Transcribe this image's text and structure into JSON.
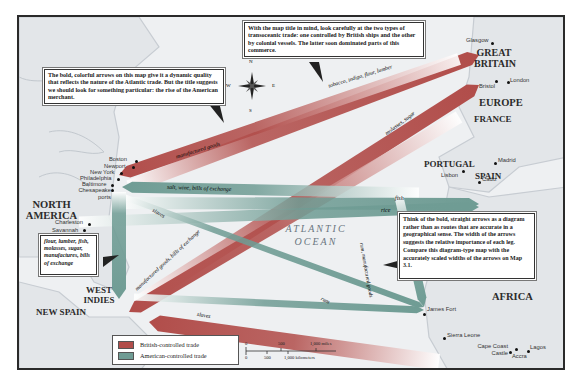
{
  "map": {
    "legend": {
      "british_label": "British-controlled trade",
      "american_label": "American-controlled trade",
      "british_color": "#b14d4a",
      "american_color": "#6f9c94"
    },
    "callouts": {
      "top": "With the map title in mind, look carefully at the two types of transoceanic trade: one controlled by British ships and the other by colonial vessels. The latter soon dominated parts of this commerce.",
      "left": "The bold, colorful arrows on this map give it a dynamic quality that reflects the nature of the Atlantic trade. But the title suggests we should look for something particular: the rise of the American merchant.",
      "right": "Think of the bold, straight arrows as a diagram rather than as routes that are accurate in a geographical sense. The width of the arrows suggests the relative importance of each leg. Compare this diagram-type map with the accurately scaled widths of the arrows on Map 3.1.",
      "goods": "flour, lumber, fish, molasses, sugar, manufactures, bills of exchange"
    },
    "compass": {
      "n": "N",
      "s": "S",
      "e": "E",
      "w": "W"
    },
    "regions": {
      "north_america": "NORTH AMERICA",
      "great_britain": "GREAT BRITAIN",
      "europe": "EUROPE",
      "france": "FRANCE",
      "portugal": "PORTUGAL",
      "spain": "SPAIN",
      "africa": "AFRICA",
      "west_indies": "WEST INDIES",
      "new_spain": "NEW SPAIN",
      "ocean": "ATLANTIC OCEAN"
    },
    "cities": {
      "boston": "Boston",
      "newport": "Newport",
      "new_york": "New York",
      "philadelphia": "Philadelphia",
      "baltimore": "Baltimore",
      "chesapeake": "Chesapeake ports",
      "charleston": "Charleston",
      "savannah": "Savannah",
      "glasgow": "Glasgow",
      "bristol": "Bristol",
      "london": "London",
      "madrid": "Madrid",
      "lisbon": "Lisbon",
      "cadiz": "Cadiz",
      "james_fort": "James Fort",
      "sierra_leone": "Sierra Leone",
      "cape_coast": "Cape Coast Castle",
      "accra": "Accra",
      "lagos": "Lagos"
    },
    "routes": {
      "tobacco": "tobacco, indigo, flour, lumber",
      "manufactured_goods": "manufactured goods",
      "molasses": "molasses, sugar",
      "salt": "salt, wine, bills of exchange",
      "slaves_na": "slaves",
      "fish": "fish",
      "rice": "rice",
      "rum_mfg": "rum, manufactured goods",
      "mfg_bills": "manufactured goods, bills of exchange",
      "rum": "rum",
      "slaves_wi": "slaves"
    },
    "scale": {
      "miles": [
        "0",
        "500",
        "1,000 miles"
      ],
      "km": [
        "0",
        "500",
        "1,000 kilometers"
      ]
    }
  }
}
